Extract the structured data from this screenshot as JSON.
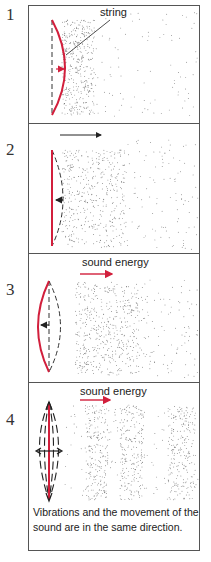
{
  "panels": [
    {
      "number": "1",
      "label": "string"
    },
    {
      "number": "2"
    },
    {
      "number": "3",
      "label": "sound energy"
    },
    {
      "number": "4",
      "label": "sound energy"
    }
  ],
  "caption": "Vibrations and the movement of the sound are in the same direction.",
  "colors": {
    "string": "#d21f3c",
    "outline": "#555555",
    "particles": "#555555"
  }
}
